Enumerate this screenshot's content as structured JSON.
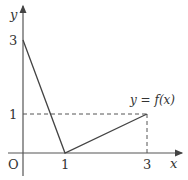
{
  "diagram": {
    "title": "",
    "axes": {
      "x_label": "x",
      "y_label": "y",
      "origin_label": "O",
      "x_ticks": [
        "1",
        "3"
      ],
      "y_ticks": [
        "3",
        "1"
      ]
    },
    "curve_label": "y = f(x)",
    "function_points": [
      [
        0,
        3
      ],
      [
        1,
        0
      ],
      [
        3,
        1
      ]
    ],
    "guide_lines": [
      {
        "from": [
          0,
          1
        ],
        "to": [
          3,
          1
        ],
        "style": "dashed"
      },
      {
        "from": [
          3,
          0
        ],
        "to": [
          3,
          1
        ],
        "style": "dashed"
      }
    ],
    "colors": {
      "line": "#444444",
      "axis": "#555555",
      "text": "#333333"
    }
  }
}
